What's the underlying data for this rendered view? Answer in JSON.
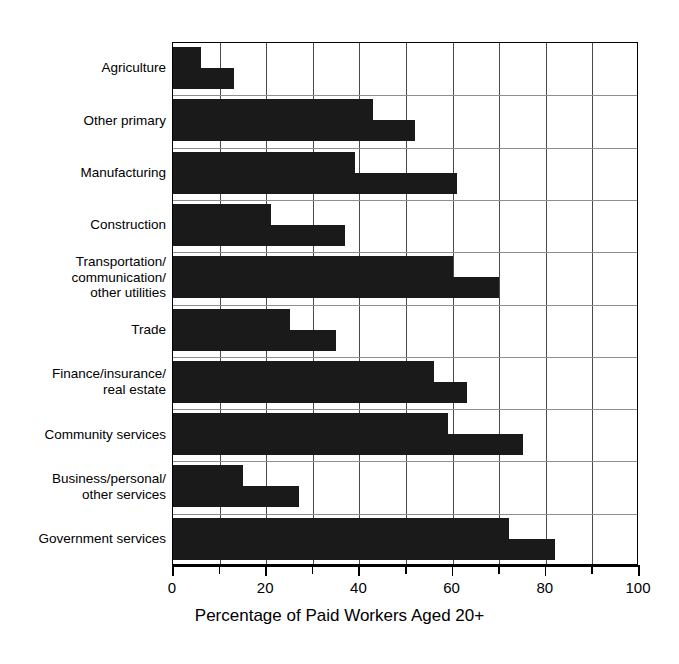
{
  "chart_data": {
    "type": "bar",
    "orientation": "horizontal",
    "title": "",
    "xlabel": "Percentage of Paid Workers Aged 20+",
    "ylabel": "",
    "xlim": [
      0,
      100
    ],
    "xticks": [
      0,
      20,
      40,
      60,
      80,
      100
    ],
    "xtick_labels": [
      "0",
      "20",
      "40",
      "60",
      "80",
      "100"
    ],
    "minor_xticks": [
      10,
      30,
      50,
      70,
      90
    ],
    "grid": "vertical",
    "legend": "none",
    "bar_color": "#1a1a1a",
    "categories": [
      "Agriculture",
      "Other primary",
      "Manufacturing",
      "Construction",
      "Transportation/\ncommunication/\nother utilities",
      "Trade",
      "Finance/insurance/\nreal estate",
      "Community services",
      "Business/personal/\nother services",
      "Government services"
    ],
    "series": [
      {
        "name": "upper bar",
        "values": [
          6,
          43,
          39,
          21,
          60,
          25,
          56,
          59,
          15,
          72
        ]
      },
      {
        "name": "lower bar",
        "values": [
          13,
          52,
          61,
          37,
          70,
          35,
          63,
          75,
          27,
          82
        ]
      }
    ]
  }
}
